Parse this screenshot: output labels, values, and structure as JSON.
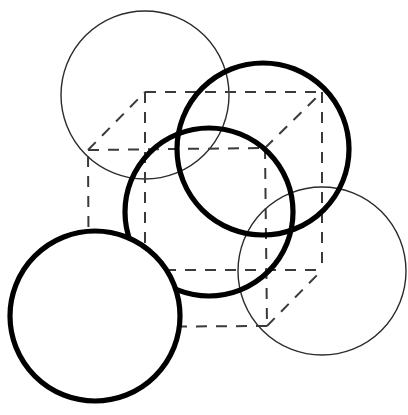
{
  "figure": {
    "canvas": {
      "width": 408,
      "height": 415,
      "background": "#ffffff"
    },
    "colors": {
      "background": "#ffffff",
      "thin_stroke": "#2b2b2b",
      "bold_stroke": "#000000",
      "dashed_stroke": "#3a3a3a"
    },
    "stroke_widths": {
      "thin": 1.4,
      "bold": 5.2,
      "dashed": 2
    },
    "dash_pattern": "11 9"
  },
  "chart_data": {
    "type": "scatter",
    "xlabel": "",
    "ylabel": "",
    "xlim": [
      0,
      408
    ],
    "ylim": [
      0,
      415
    ],
    "grid": false,
    "legend": "none",
    "circles": [
      {
        "name": "top-left-circle",
        "weight": "thin",
        "cx": 145,
        "cy": 95,
        "r": 84,
        "stroke": "#2b2b2b",
        "stroke_width": 1.4
      },
      {
        "name": "top-right-circle",
        "weight": "bold",
        "cx": 263,
        "cy": 149,
        "r": 86,
        "stroke": "#000000",
        "stroke_width": 5.2
      },
      {
        "name": "center-circle",
        "weight": "bold",
        "cx": 209,
        "cy": 212,
        "r": 84,
        "stroke": "#000000",
        "stroke_width": 5.2
      },
      {
        "name": "bottom-left-circle",
        "weight": "bold",
        "cx": 95,
        "cy": 316,
        "r": 85,
        "stroke": "#000000",
        "stroke_width": 5.2
      },
      {
        "name": "bottom-right-circle",
        "weight": "thin",
        "cx": 322,
        "cy": 271,
        "r": 84,
        "stroke": "#2b2b2b",
        "stroke_width": 1.4
      }
    ],
    "cube": {
      "name": "dashed-wireframe-cube",
      "stroke": "#3a3a3a",
      "stroke_width": 2,
      "dash": "11 9",
      "vertices": {
        "front_top_left": [
          88,
          150
        ],
        "front_top_right": [
          265,
          148
        ],
        "front_bottom_right": [
          267,
          326
        ],
        "front_bottom_left": [
          89,
          327
        ],
        "back_top_left": [
          145,
          92
        ],
        "back_top_right": [
          322,
          92
        ],
        "back_bottom_right": [
          322,
          270
        ],
        "back_bottom_left": [
          145,
          270
        ]
      },
      "edges": [
        [
          "front_top_left",
          "front_top_right"
        ],
        [
          "front_top_right",
          "front_bottom_right"
        ],
        [
          "front_bottom_right",
          "front_bottom_left"
        ],
        [
          "front_bottom_left",
          "front_top_left"
        ],
        [
          "back_top_left",
          "back_top_right"
        ],
        [
          "back_top_right",
          "back_bottom_right"
        ],
        [
          "front_top_left",
          "back_top_left"
        ],
        [
          "front_top_right",
          "back_top_right"
        ],
        [
          "front_bottom_right",
          "back_bottom_right"
        ]
      ],
      "hidden_edges": [
        [
          "back_top_left",
          "back_bottom_left"
        ],
        [
          "back_bottom_left",
          "back_bottom_right"
        ],
        [
          "front_bottom_left",
          "back_bottom_left"
        ]
      ]
    }
  }
}
